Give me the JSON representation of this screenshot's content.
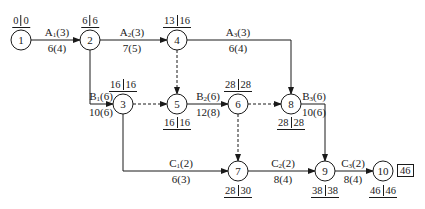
{
  "diagram": {
    "type": "activity-on-arrow network",
    "nodes": [
      {
        "id": "1",
        "x": 21,
        "y": 40,
        "time": {
          "es": "0",
          "ls": "0"
        },
        "time_pos": "top"
      },
      {
        "id": "2",
        "x": 90,
        "y": 40,
        "time": {
          "es": "6",
          "ls": "6"
        },
        "time_pos": "top"
      },
      {
        "id": "3",
        "x": 123,
        "y": 104,
        "time": {
          "es": "16",
          "ls": "16"
        },
        "time_pos": "top"
      },
      {
        "id": "4",
        "x": 177,
        "y": 40,
        "time": {
          "es": "13",
          "ls": "16"
        },
        "time_pos": "top"
      },
      {
        "id": "5",
        "x": 177,
        "y": 104,
        "time": {
          "es": "16",
          "ls": "16"
        },
        "time_pos": "bottom"
      },
      {
        "id": "6",
        "x": 238,
        "y": 104,
        "time": {
          "es": "28",
          "ls": "28"
        },
        "time_pos": "top"
      },
      {
        "id": "7",
        "x": 238,
        "y": 171,
        "time": {
          "es": "28",
          "ls": "30"
        },
        "time_pos": "bottom"
      },
      {
        "id": "8",
        "x": 291,
        "y": 104,
        "time": {
          "es": "28",
          "ls": "28"
        },
        "time_pos": "bottom"
      },
      {
        "id": "9",
        "x": 325,
        "y": 171,
        "time": {
          "es": "38",
          "ls": "38"
        },
        "time_pos": "bottom"
      },
      {
        "id": "10",
        "x": 383,
        "y": 171,
        "time": {
          "es": "46",
          "ls": "46"
        },
        "time_pos": "bottom"
      }
    ],
    "activities": [
      {
        "name": "A",
        "sub": "1",
        "resource": "3",
        "duration": "6(4)",
        "from": "1",
        "to": "2"
      },
      {
        "name": "A",
        "sub": "2",
        "resource": "3",
        "duration": "7(5)",
        "from": "2",
        "to": "4"
      },
      {
        "name": "A",
        "sub": "3",
        "resource": "3",
        "duration": "6(4)",
        "from": "4",
        "to": "8"
      },
      {
        "name": "B",
        "sub": "1",
        "resource": "6",
        "duration": "10(6)",
        "from": "2",
        "to": "3"
      },
      {
        "name": "B",
        "sub": "2",
        "resource": "6",
        "duration": "12(8)",
        "from": "5",
        "to": "6"
      },
      {
        "name": "B",
        "sub": "3",
        "resource": "6",
        "duration": "10(6)",
        "from": "8",
        "to": "9"
      },
      {
        "name": "C",
        "sub": "1",
        "resource": "2",
        "duration": "6(3)",
        "from": "3",
        "to": "7"
      },
      {
        "name": "C",
        "sub": "2",
        "resource": "2",
        "duration": "8(4)",
        "from": "7",
        "to": "9"
      },
      {
        "name": "C",
        "sub": "3",
        "resource": "2",
        "duration": "8(4)",
        "from": "9",
        "to": "10"
      }
    ],
    "dummies": [
      {
        "from": "4",
        "to": "5"
      },
      {
        "from": "3",
        "to": "5"
      },
      {
        "from": "6",
        "to": "8"
      },
      {
        "from": "6",
        "to": "7"
      }
    ],
    "project_duration": "46"
  }
}
